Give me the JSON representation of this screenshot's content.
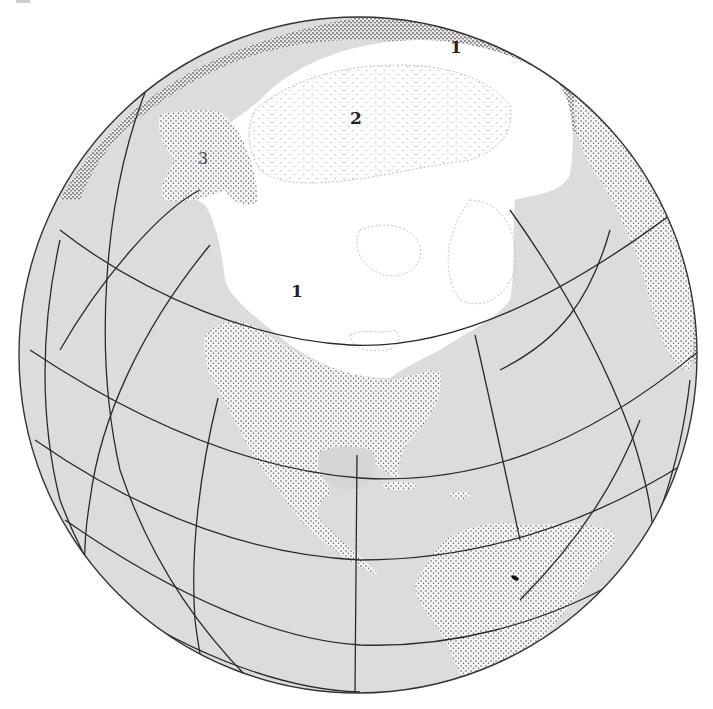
{
  "figure": {
    "type": "orthographic-globe-map",
    "colors": {
      "ocean": "#dcdcdc",
      "ice": "#ffffff",
      "land_stipple": "#3a3a3a",
      "graticule": "#2a2a2a",
      "outline": "#333333",
      "label": "#222222"
    },
    "labels": [
      {
        "id": "zone-1-north",
        "text": "1",
        "x": 455,
        "y": 53
      },
      {
        "id": "zone-2",
        "text": "2",
        "x": 356,
        "y": 122
      },
      {
        "id": "zone-3",
        "text": "3",
        "x": 203,
        "y": 162
      },
      {
        "id": "zone-1-central",
        "text": "1",
        "x": 296,
        "y": 295
      }
    ]
  }
}
